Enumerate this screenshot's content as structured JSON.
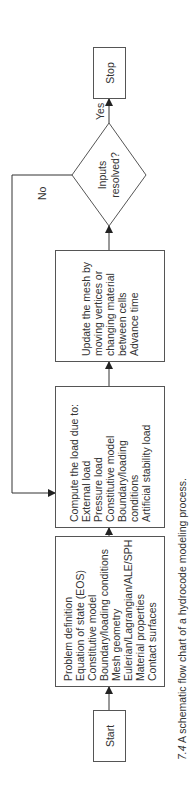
{
  "nodes": {
    "start": {
      "label": "Start"
    },
    "problem_definition": {
      "lines": [
        "Problem definition",
        "Equation of state (EOS)",
        "Constitutive model",
        "Boundary/loading conditions",
        "Mesh geometry",
        "Eulerian/Lagrangian/ALE/SPH",
        "Material properties",
        "Contact surfaces"
      ]
    },
    "compute_load": {
      "lines": [
        "Compute the load due to:",
        "External load",
        "Pressure load",
        "Constitutive model",
        "Boundary/loading",
        "conditions",
        "Artificial stability load"
      ]
    },
    "update_mesh": {
      "lines": [
        "Update the mesh by",
        "moving vertices or",
        "changing material",
        "between cells",
        "Advance time"
      ]
    },
    "decision": {
      "lines": [
        "Inputs",
        "resolved?"
      ]
    },
    "stop": {
      "label": "Stop"
    }
  },
  "edges": {
    "yes_label": "Yes",
    "no_label": "No"
  },
  "caption": {
    "number": "7.4",
    "text": "A schematic flow chart of a hydrocode modeling process."
  }
}
